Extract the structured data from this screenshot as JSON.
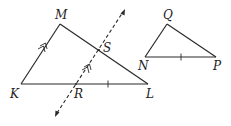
{
  "diagram": {
    "triangle_KLM": {
      "vertices": {
        "K": {
          "label": "K",
          "x": 21,
          "y": 84
        },
        "L": {
          "label": "L",
          "x": 148,
          "y": 84
        },
        "M": {
          "label": "M",
          "x": 60,
          "y": 24
        }
      }
    },
    "transversal": {
      "style": "dashed",
      "arrows": "both ends",
      "points": {
        "R": {
          "label": "R",
          "x": 76,
          "y": 84
        },
        "S": {
          "label": "S",
          "x": 99,
          "y": 50
        }
      },
      "start": {
        "x": 55,
        "y": 117
      },
      "end": {
        "x": 125,
        "y": 9
      }
    },
    "triangle_NPQ": {
      "vertices": {
        "N": {
          "label": "N",
          "x": 145,
          "y": 57
        },
        "P": {
          "label": "P",
          "x": 216,
          "y": 57
        },
        "Q": {
          "label": "Q",
          "x": 167,
          "y": 24
        }
      }
    },
    "markings": {
      "parallel_KM": "double arrow",
      "parallel_RS": "double arrow",
      "congruent_tick_RL": "single tick",
      "congruent_tick_NP": "single tick"
    },
    "colors": {
      "stroke": "#2a2a2a",
      "background": "#ffffff"
    }
  }
}
